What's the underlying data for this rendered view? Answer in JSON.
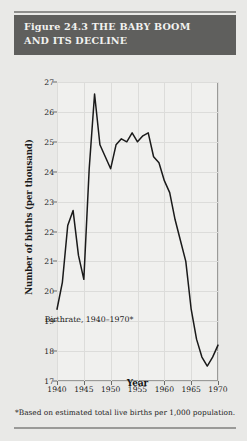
{
  "figure": {
    "label": "Figure 24.3",
    "title_line1": "Figure 24.3  THE BABY BOOM",
    "title_line2": "AND ITS DECLINE",
    "footnote": "*Based on estimated total live births per 1,000 population.",
    "header_bg": "#5f5f5d",
    "header_text_color": "#f2f2f0",
    "page_bg": "#e9e9e7",
    "plot_bg": "#f0f0ee",
    "line_color": "#1a1a1a"
  },
  "chart_data": {
    "type": "line",
    "title": "Figure 24.3  THE BABY BOOM AND ITS DECLINE",
    "xlabel": "Year",
    "ylabel": "Number of births (per thousand)",
    "xlim": [
      1940,
      1970
    ],
    "ylim": [
      17,
      27
    ],
    "xticks": [
      1940,
      1945,
      1950,
      1955,
      1960,
      1965,
      1970
    ],
    "yticks": [
      17,
      18,
      19,
      20,
      21,
      22,
      23,
      24,
      25,
      26,
      27
    ],
    "grid": true,
    "legend": null,
    "annotations": [
      {
        "text": "Birthrate, 1940–1970*",
        "x": 1954,
        "y": 19.2
      }
    ],
    "series": [
      {
        "name": "Birthrate, 1940–1970*",
        "x": [
          1940,
          1941,
          1942,
          1943,
          1944,
          1945,
          1946,
          1947,
          1948,
          1949,
          1950,
          1951,
          1952,
          1953,
          1954,
          1955,
          1956,
          1957,
          1958,
          1959,
          1960,
          1961,
          1962,
          1963,
          1964,
          1965,
          1966,
          1967,
          1968,
          1969,
          1970
        ],
        "y": [
          19.4,
          20.3,
          22.2,
          22.7,
          21.2,
          20.4,
          24.1,
          26.6,
          24.9,
          24.5,
          24.1,
          24.9,
          25.1,
          25.0,
          25.3,
          25.0,
          25.2,
          25.3,
          24.5,
          24.3,
          23.7,
          23.3,
          22.4,
          21.7,
          21.0,
          19.4,
          18.4,
          17.8,
          17.5,
          17.8,
          18.2
        ]
      }
    ]
  },
  "axis": {
    "y_title": "Number of births (per thousand)",
    "x_title": "Year"
  }
}
